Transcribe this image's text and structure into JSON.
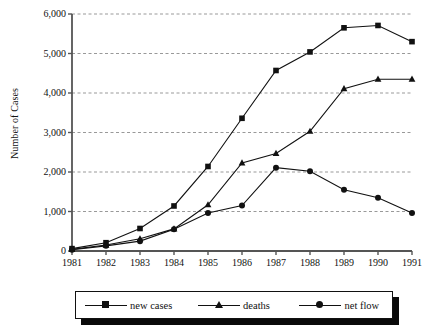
{
  "chart_data": {
    "type": "line",
    "title": "",
    "xlabel": "",
    "ylabel": "Number of Cases",
    "categories": [
      "1981",
      "1982",
      "1983",
      "1984",
      "1985",
      "1986",
      "1987",
      "1988",
      "1989",
      "1990",
      "1991"
    ],
    "ylim": [
      0,
      6000
    ],
    "yticks": [
      0,
      1000,
      2000,
      3000,
      4000,
      5000,
      6000
    ],
    "ytick_labels": [
      "0",
      "1,000",
      "2,000",
      "3,000",
      "4,000",
      "5,000",
      "6,000"
    ],
    "grid": "horizontal-dashed",
    "legend_position": "bottom",
    "series": [
      {
        "name": "new cases",
        "marker": "square",
        "values": [
          60,
          210,
          570,
          1140,
          2140,
          3360,
          4570,
          5040,
          5650,
          5710,
          5300
        ]
      },
      {
        "name": "deaths",
        "marker": "triangle",
        "values": [
          40,
          150,
          310,
          560,
          1170,
          2230,
          2470,
          3030,
          4110,
          4350,
          4350
        ]
      },
      {
        "name": "net flow",
        "marker": "circle",
        "values": [
          30,
          130,
          250,
          550,
          960,
          1150,
          2110,
          2020,
          1550,
          1350,
          960
        ]
      }
    ]
  },
  "legend": {
    "items": [
      {
        "label": "new cases",
        "marker": "square"
      },
      {
        "label": "deaths",
        "marker": "triangle"
      },
      {
        "label": "net flow",
        "marker": "circle"
      }
    ]
  },
  "colors": {
    "line": "#111111",
    "grid": "#999999",
    "axis": "#555555",
    "background": "#ffffff"
  }
}
